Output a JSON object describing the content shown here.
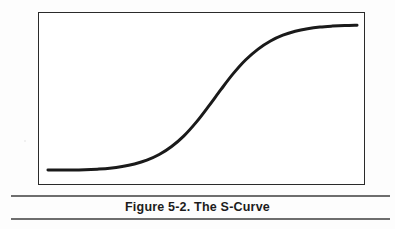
{
  "figure": {
    "caption": "Figure 5-2. The S-Curve",
    "caption_label": "Figure 5-2.",
    "caption_title": "The S-Curve",
    "background_color": "#fdfdfd",
    "plot_background_color": "#ffffff",
    "frame_color": "#2a2a2a",
    "rule_color": "#6e6e6e",
    "curve_color": "#1a1a1a",
    "caption_color": "#1c1c1c"
  },
  "chart_data": {
    "type": "line",
    "title": "Figure 5-2. The S-Curve",
    "subtitle": "",
    "xlabel": "",
    "ylabel": "",
    "xlim": [
      0,
      100
    ],
    "ylim": [
      0,
      100
    ],
    "grid": false,
    "legend": "none",
    "axis_ticks": {
      "x": [],
      "y": []
    },
    "annotations": [],
    "series": [
      {
        "name": "S-Curve",
        "x": [
          0,
          4,
          8,
          12,
          16,
          20,
          24,
          28,
          32,
          36,
          40,
          44,
          48,
          52,
          56,
          60,
          64,
          68,
          72,
          76,
          80,
          84,
          88,
          92,
          96,
          100
        ],
        "y": [
          2,
          2,
          2,
          2.2,
          2.6,
          3.2,
          4.3,
          6.0,
          8.5,
          12.2,
          17.5,
          24.5,
          33.5,
          44.0,
          55.0,
          65.5,
          74.5,
          81.5,
          86.8,
          90.6,
          93.2,
          94.9,
          96.0,
          96.6,
          97.0,
          97.2
        ]
      }
    ]
  }
}
